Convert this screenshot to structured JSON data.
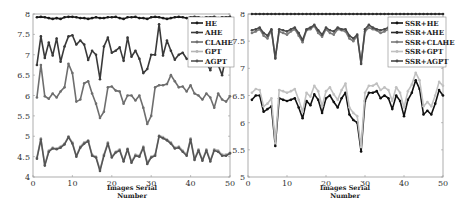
{
  "chart_data": [
    {
      "type": "line",
      "panel": "left",
      "title": "",
      "xlabel": "Images Serial Number",
      "ylabel": "",
      "xlim": [
        0,
        50
      ],
      "ylim": [
        4,
        8
      ],
      "xticks": [
        0,
        10,
        20,
        30,
        40,
        50
      ],
      "yticks": [
        4,
        4.5,
        5,
        5.5,
        6,
        6.5,
        7,
        7.5,
        8
      ],
      "ytick_labels": [
        "4",
        "4.5",
        "5",
        "5.5",
        "6",
        "6.5",
        "7",
        "7.5",
        "8"
      ],
      "grid": false,
      "legend_position": "upper right",
      "x": [
        1,
        2,
        3,
        4,
        5,
        6,
        7,
        8,
        9,
        10,
        11,
        12,
        13,
        14,
        15,
        16,
        17,
        18,
        19,
        20,
        21,
        22,
        23,
        24,
        25,
        26,
        27,
        28,
        29,
        30,
        31,
        32,
        33,
        34,
        35,
        36,
        37,
        38,
        39,
        40,
        41,
        42,
        43,
        44,
        45,
        46,
        47,
        48,
        49,
        50
      ],
      "series": [
        {
          "name": "HE",
          "color": "#1a1a1a",
          "marker": "circle",
          "values": [
            7.92,
            7.93,
            7.92,
            7.9,
            7.88,
            7.9,
            7.88,
            7.92,
            7.93,
            7.93,
            7.92,
            7.9,
            7.9,
            7.88,
            7.9,
            7.92,
            7.9,
            7.9,
            7.92,
            7.92,
            7.93,
            7.9,
            7.88,
            7.92,
            7.92,
            7.93,
            7.9,
            7.9,
            7.88,
            7.92,
            7.93,
            7.92,
            7.9,
            7.88,
            7.9,
            7.92,
            7.93,
            7.92,
            7.9,
            7.92,
            7.93,
            7.92,
            7.9,
            7.92,
            7.92,
            7.93,
            7.9,
            7.92,
            7.92,
            7.93
          ]
        },
        {
          "name": "AHE",
          "color": "#3a3a3a",
          "marker": "circle",
          "values": [
            6.75,
            7.45,
            6.92,
            7.3,
            6.98,
            7.4,
            6.83,
            7.2,
            7.45,
            7.48,
            7.25,
            7.35,
            7.25,
            6.87,
            7.1,
            7.0,
            6.4,
            7.2,
            7.42,
            7.05,
            7.1,
            7.18,
            6.85,
            7.42,
            6.95,
            7.1,
            6.9,
            6.55,
            6.65,
            7.0,
            7.0,
            7.75,
            6.98,
            7.35,
            7.1,
            6.88,
            7.0,
            7.05,
            6.9,
            6.9,
            6.75,
            7.15,
            6.95,
            6.8,
            6.62,
            6.95,
            6.75,
            6.5,
            7.0,
            7.0
          ]
        },
        {
          "name": "CLAHE",
          "color": "#6e6e6e",
          "marker": "circle",
          "values": [
            5.95,
            6.75,
            5.98,
            5.92,
            6.05,
            5.95,
            6.1,
            6.2,
            6.78,
            6.55,
            5.85,
            5.9,
            6.3,
            6.35,
            6.05,
            5.8,
            5.45,
            5.6,
            6.2,
            6.22,
            6.12,
            6.1,
            5.8,
            6.0,
            6.0,
            5.88,
            6.0,
            5.7,
            5.3,
            5.5,
            6.2,
            6.25,
            6.25,
            6.28,
            6.5,
            6.35,
            6.2,
            6.22,
            6.1,
            6.25,
            6.05,
            6.0,
            5.9,
            6.05,
            5.95,
            5.7,
            6.05,
            5.9,
            5.85,
            5.98
          ]
        },
        {
          "name": "GPT",
          "color": "#b5b5b5",
          "marker": "circle",
          "values": [
            4.48,
            4.95,
            4.3,
            4.65,
            4.72,
            4.7,
            4.75,
            4.82,
            5.0,
            4.85,
            4.52,
            4.75,
            4.85,
            4.9,
            4.55,
            4.5,
            4.18,
            4.55,
            4.85,
            4.5,
            4.62,
            4.68,
            4.4,
            4.7,
            4.38,
            4.55,
            4.52,
            4.75,
            4.35,
            4.5,
            4.55,
            5.02,
            4.98,
            4.92,
            4.85,
            4.72,
            4.75,
            4.65,
            4.55,
            4.95,
            4.45,
            4.68,
            4.42,
            4.68,
            4.4,
            4.68,
            4.65,
            4.55,
            4.55,
            4.6
          ]
        },
        {
          "name": "AGPT",
          "color": "#555555",
          "marker": "circle",
          "values": [
            4.45,
            4.92,
            4.28,
            4.62,
            4.7,
            4.68,
            4.72,
            4.8,
            4.98,
            4.82,
            4.5,
            4.72,
            4.82,
            4.88,
            4.52,
            4.48,
            4.15,
            4.52,
            4.82,
            4.48,
            4.6,
            4.65,
            4.38,
            4.68,
            4.35,
            4.52,
            4.5,
            4.72,
            4.32,
            4.48,
            4.52,
            5.0,
            4.95,
            4.9,
            4.82,
            4.7,
            4.72,
            4.62,
            4.52,
            4.92,
            4.42,
            4.65,
            4.4,
            4.65,
            4.38,
            4.65,
            4.62,
            4.52,
            4.52,
            4.58
          ]
        }
      ]
    },
    {
      "type": "line",
      "panel": "right",
      "title": "",
      "xlabel": "Images Serial Number",
      "ylabel": "",
      "xlim": [
        0,
        50
      ],
      "ylim": [
        5,
        8
      ],
      "xticks": [
        0,
        10,
        20,
        30,
        40,
        50
      ],
      "yticks": [
        5,
        5.5,
        6,
        6.5,
        7,
        7.5,
        8
      ],
      "ytick_labels": [
        "5",
        "5.5",
        "6",
        "6.5",
        "7",
        "7.5",
        "8"
      ],
      "grid": false,
      "legend_position": "upper right",
      "x": [
        1,
        2,
        3,
        4,
        5,
        6,
        7,
        8,
        9,
        10,
        11,
        12,
        13,
        14,
        15,
        16,
        17,
        18,
        19,
        20,
        21,
        22,
        23,
        24,
        25,
        26,
        27,
        28,
        29,
        30,
        31,
        32,
        33,
        34,
        35,
        36,
        37,
        38,
        39,
        40,
        41,
        42,
        43,
        44,
        45,
        46,
        47,
        48,
        49,
        50
      ],
      "series": [
        {
          "name": "SSR+HE",
          "color": "#111111",
          "marker": "circle",
          "values": [
            6.42,
            6.5,
            6.5,
            6.2,
            6.25,
            6.3,
            5.57,
            6.45,
            6.42,
            6.4,
            6.42,
            6.45,
            6.28,
            6.08,
            6.4,
            6.32,
            6.52,
            6.42,
            6.18,
            6.45,
            6.5,
            6.38,
            6.28,
            6.45,
            6.55,
            6.15,
            6.05,
            6.0,
            5.47,
            6.4,
            6.55,
            6.55,
            6.58,
            6.45,
            6.5,
            6.45,
            6.25,
            6.5,
            6.4,
            6.12,
            6.42,
            6.55,
            6.78,
            6.62,
            6.15,
            6.22,
            6.15,
            6.35,
            6.6,
            6.5
          ]
        },
        {
          "name": "SSR+AHE",
          "color": "#2a2a2a",
          "marker": "circle",
          "values": [
            8.0,
            8.0,
            8.0,
            8.0,
            8.0,
            8.0,
            8.0,
            8.0,
            8.0,
            8.0,
            8.0,
            8.0,
            8.0,
            8.0,
            8.0,
            8.0,
            8.0,
            8.0,
            8.0,
            8.0,
            8.0,
            8.0,
            8.0,
            8.0,
            8.0,
            8.0,
            8.0,
            8.0,
            8.0,
            8.0,
            8.0,
            8.0,
            8.0,
            8.0,
            8.0,
            8.0,
            8.0,
            8.0,
            8.0,
            8.0,
            8.0,
            8.0,
            8.0,
            8.0,
            8.0,
            8.0,
            8.0,
            8.0,
            8.0,
            8.0
          ]
        },
        {
          "name": "SSR+CLAHE",
          "color": "#7a7a7a",
          "marker": "circle",
          "values": [
            7.65,
            7.68,
            7.72,
            7.6,
            7.55,
            7.7,
            7.2,
            7.68,
            7.65,
            7.62,
            7.68,
            7.72,
            7.6,
            7.48,
            7.7,
            7.72,
            7.78,
            7.65,
            7.58,
            7.72,
            7.65,
            7.62,
            7.72,
            7.7,
            7.68,
            7.55,
            7.5,
            7.6,
            7.1,
            7.68,
            7.75,
            7.72,
            7.7,
            7.65,
            7.68,
            7.72,
            7.62,
            7.7,
            7.72,
            7.6,
            7.7,
            7.72,
            7.75,
            7.68,
            7.65,
            7.62,
            7.7,
            7.72,
            7.68,
            7.75
          ]
        },
        {
          "name": "SSR+GPT",
          "color": "#c0c0c0",
          "marker": "circle",
          "values": [
            6.55,
            6.62,
            6.6,
            6.3,
            6.35,
            6.45,
            5.62,
            6.6,
            6.58,
            6.55,
            6.58,
            6.62,
            6.42,
            6.2,
            6.55,
            6.48,
            6.68,
            6.58,
            6.3,
            6.58,
            6.65,
            6.52,
            6.42,
            6.6,
            6.72,
            6.28,
            6.18,
            6.12,
            5.55,
            6.55,
            6.68,
            6.68,
            6.72,
            6.6,
            6.65,
            6.6,
            6.4,
            6.65,
            6.55,
            6.28,
            6.58,
            6.7,
            6.92,
            6.78,
            6.3,
            6.38,
            6.3,
            6.5,
            6.75,
            6.68
          ]
        },
        {
          "name": "SSR+AGPT",
          "color": "#4a4a4a",
          "marker": "circle",
          "values": [
            7.7,
            7.72,
            7.75,
            7.65,
            7.6,
            7.72,
            7.18,
            7.72,
            7.7,
            7.68,
            7.72,
            7.75,
            7.65,
            7.52,
            7.72,
            7.75,
            7.8,
            7.7,
            7.62,
            7.75,
            7.7,
            7.68,
            7.75,
            7.72,
            7.72,
            7.6,
            7.55,
            7.62,
            7.08,
            7.72,
            7.8,
            7.75,
            7.72,
            7.7,
            7.72,
            7.75,
            7.68,
            7.72,
            7.75,
            7.65,
            7.72,
            7.75,
            7.78,
            7.72,
            7.7,
            7.68,
            7.72,
            7.75,
            7.72,
            7.78
          ]
        }
      ]
    }
  ],
  "panels": {
    "left": {
      "xlabel": "Images Serial Number",
      "legend": [
        "HE",
        "AHE",
        "CLAHE",
        "GPT",
        "AGPT"
      ]
    },
    "right": {
      "xlabel": "Images Serial Number",
      "legend": [
        "SSR+HE",
        "SSR+AHE",
        "SSR+CLAHE",
        "SSR+GPT",
        "SSR+AGPT"
      ]
    }
  }
}
